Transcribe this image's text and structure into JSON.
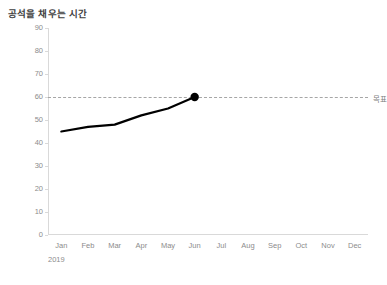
{
  "chart_data": {
    "type": "line",
    "title": "공석을 채우는 시간",
    "xlabel": "",
    "ylabel": "공석을 채우는 시간(일수)",
    "period_label": "2019",
    "categories": [
      "Jan",
      "Feb",
      "Mar",
      "Apr",
      "May",
      "Jun",
      "Jul",
      "Aug",
      "Sep",
      "Oct",
      "Nov",
      "Dec"
    ],
    "series": [
      {
        "name": "공석을 채우는 시간",
        "values": [
          45,
          47,
          48,
          52,
          55,
          60,
          null,
          null,
          null,
          null,
          null,
          null
        ],
        "color": "#000000",
        "marker_on_last_point": true
      }
    ],
    "ylim": [
      0,
      90
    ],
    "yticks": [
      0,
      10,
      20,
      30,
      40,
      50,
      60,
      70,
      80,
      90
    ],
    "ytick_labels": [
      "0",
      "10",
      "20",
      "30",
      "40",
      "50",
      "60",
      "70",
      "80",
      "90"
    ],
    "grid": false,
    "legend": "none",
    "reference_line": {
      "label": "목표",
      "value": 60,
      "style": "dashed",
      "color": "#a6a6a6"
    },
    "axis_color": "#d9d9d9",
    "text_color": "#8c8c8c",
    "title_color": "#3f3f3f",
    "background": "#ffffff"
  }
}
